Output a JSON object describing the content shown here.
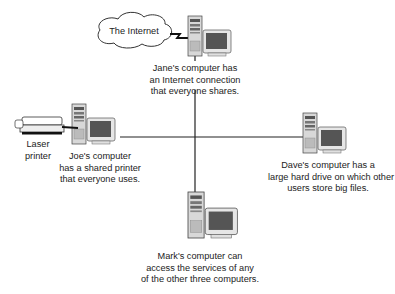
{
  "diagram": {
    "cloud": {
      "label": "The Internet",
      "icon": "cloud-icon"
    },
    "nodes": [
      {
        "id": "jane",
        "icon": "desktop-computer-icon",
        "caption": [
          "Jane's computer has",
          "an Internet connection",
          "that everyone shares."
        ]
      },
      {
        "id": "joe",
        "icon": "desktop-computer-icon",
        "caption": [
          "Joe's computer",
          "has a shared printer",
          "that everyone uses."
        ]
      },
      {
        "id": "dave",
        "icon": "desktop-computer-icon",
        "caption": [
          "Dave's computer has a",
          "large hard drive on which other",
          "users store big files."
        ]
      },
      {
        "id": "mark",
        "icon": "desktop-computer-icon",
        "caption": [
          "Mark's computer can",
          "access the services of any",
          "of the other three computers."
        ]
      }
    ],
    "printer": {
      "label": [
        "Laser",
        "printer"
      ],
      "icon": "laser-printer-icon"
    },
    "colors": {
      "line": "#222222",
      "tower": "#d8d8d8",
      "screen": "#555555",
      "bezel": "#e6e6e6"
    }
  }
}
